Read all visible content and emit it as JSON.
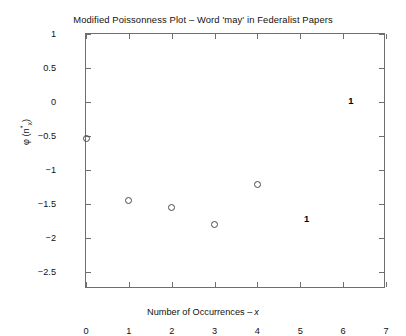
{
  "chart_data": {
    "type": "scatter",
    "title": "Modified Poissonness Plot – Word 'may' in Federalist Papers",
    "xlabel_main": "Number of Occurrences –",
    "xlabel_italic": "x",
    "ylabel_parts": {
      "phi": "φ (n",
      "star": "*",
      "sub": "x",
      "close": ")"
    },
    "ylabel_plain": "φ (n*x)",
    "xlim": [
      0,
      7
    ],
    "ylim": [
      -2.75,
      1
    ],
    "grid": false,
    "legend": null,
    "xticks": [
      0,
      1,
      2,
      3,
      4,
      5,
      6,
      7
    ],
    "xtick_labels": [
      "0",
      "1",
      "2",
      "3",
      "4",
      "5",
      "6",
      "7"
    ],
    "yticks": [
      1,
      0.5,
      0,
      -0.5,
      -1,
      -1.5,
      -2,
      -2.5
    ],
    "ytick_labels": [
      "1",
      "0.5",
      "0",
      "-0.5",
      "-1",
      "-1.5",
      "-2",
      "-2.5"
    ],
    "series": [
      {
        "name": "observed",
        "marker": "open-circle",
        "points": [
          {
            "x": 0,
            "y": -0.53
          },
          {
            "x": 1,
            "y": -1.45
          },
          {
            "x": 2,
            "y": -1.55
          },
          {
            "x": 3,
            "y": -1.8
          },
          {
            "x": 4,
            "y": -1.22
          }
        ]
      }
    ],
    "annotations": [
      {
        "text": "1",
        "x": 6.18,
        "y": 0.03
      },
      {
        "text": "1",
        "x": 5.15,
        "y": -1.7
      }
    ],
    "colors": {
      "background": "#ffffff",
      "axis": "#6f6f6f",
      "marker_edge": "#4a4a4a",
      "text": "#111111"
    }
  }
}
